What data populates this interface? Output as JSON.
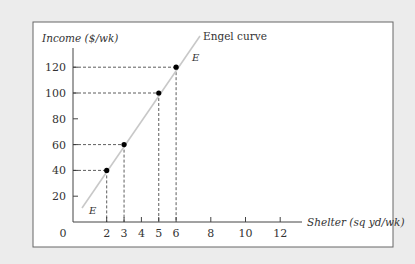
{
  "chart_data": {
    "type": "line",
    "title": "",
    "xlabel": "Shelter (sq yd/wk)",
    "ylabel": "Income ($/wk)",
    "origin_label": "0",
    "x_ticks": [
      2,
      3,
      4,
      5,
      6,
      8,
      10,
      12
    ],
    "y_ticks": [
      20,
      40,
      60,
      80,
      100,
      120
    ],
    "xlim": [
      0,
      13
    ],
    "ylim": [
      0,
      135
    ],
    "grid": false,
    "series": [
      {
        "name": "Engel curve",
        "label_ends": "E",
        "points": [
          {
            "x": 2,
            "y": 40
          },
          {
            "x": 3,
            "y": 60
          },
          {
            "x": 5,
            "y": 100
          },
          {
            "x": 6,
            "y": 120
          }
        ],
        "line_extent": [
          {
            "x": 0.6,
            "y": 12
          },
          {
            "x": 7.4,
            "y": 145
          }
        ]
      }
    ],
    "annotations": [
      {
        "text": "Engel curve",
        "anchor": "top of line"
      },
      {
        "text": "E",
        "anchor": "upper end"
      },
      {
        "text": "E",
        "anchor": "lower end"
      }
    ],
    "colors": {
      "curve": "#c8c8c8",
      "points": "#000000",
      "axes": "#444444",
      "background": "#ececec",
      "panel": "#ffffff"
    }
  }
}
